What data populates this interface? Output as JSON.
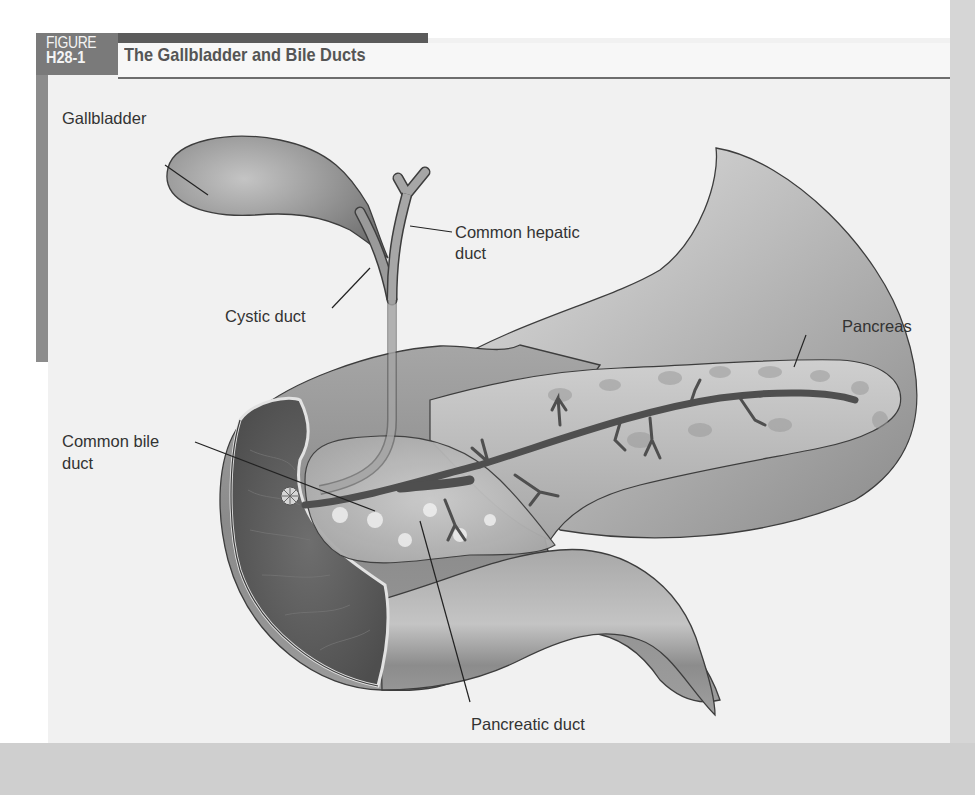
{
  "figure": {
    "tag_word": "FIGURE",
    "tag_number": "H28-1",
    "title": "The Gallbladder and Bile Ducts"
  },
  "labels": {
    "gallbladder": "Gallbladder",
    "common_hepatic_duct_line1": "Common hepatic",
    "common_hepatic_duct_line2": "duct",
    "cystic_duct": "Cystic duct",
    "pancreas": "Pancreas",
    "common_bile_duct_line1": "Common bile",
    "common_bile_duct_line2": "duct",
    "pancreatic_duct": "Pancreatic duct"
  },
  "colors": {
    "tag_bg": "#7a7a7a",
    "top_bar": "#5b5b5b",
    "panel_bg": "#f1f1f1",
    "organ_fill": "#8f8f8f",
    "organ_dark": "#5a5a5a",
    "outline": "#3d3d3d"
  }
}
